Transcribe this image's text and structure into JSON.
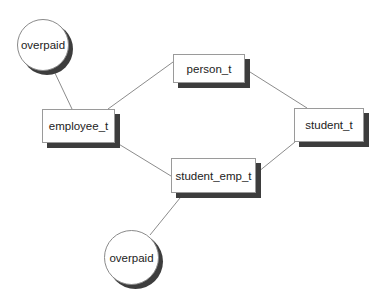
{
  "diagram": {
    "type": "type-hierarchy",
    "nodes": [
      {
        "id": "person_t",
        "label": "person_t",
        "shape": "box"
      },
      {
        "id": "employee_t",
        "label": "employee_t",
        "shape": "box"
      },
      {
        "id": "student_t",
        "label": "student_t",
        "shape": "box"
      },
      {
        "id": "student_emp_t",
        "label": "student_emp_t",
        "shape": "box"
      },
      {
        "id": "overpaid_1",
        "label": "overpaid",
        "shape": "circle"
      },
      {
        "id": "overpaid_2",
        "label": "overpaid",
        "shape": "circle"
      }
    ],
    "edges": [
      {
        "from": "overpaid_1",
        "to": "employee_t"
      },
      {
        "from": "employee_t",
        "to": "person_t"
      },
      {
        "from": "person_t",
        "to": "student_t"
      },
      {
        "from": "employee_t",
        "to": "student_emp_t"
      },
      {
        "from": "student_t",
        "to": "student_emp_t"
      },
      {
        "from": "student_emp_t",
        "to": "overpaid_2"
      }
    ]
  },
  "colors": {
    "edge": "#8c8c8c",
    "shadow": "#3d3d3d",
    "border": "#9a9a9a",
    "text": "#222222"
  }
}
